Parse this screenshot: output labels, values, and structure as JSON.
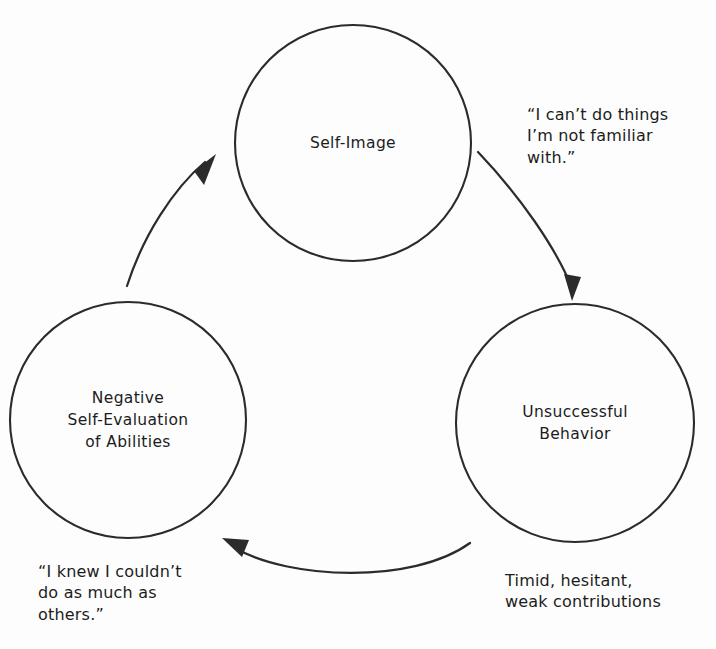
{
  "diagram": {
    "type": "cyclical-flow",
    "background_color": "#fdfdfd",
    "line_color": "#2b2b2b",
    "text_color": "#1c1c1c",
    "direction": "clockwise",
    "nodes": [
      {
        "id": "self-image",
        "label": "Self-Image",
        "position": "top",
        "center_x": 353,
        "center_y": 143,
        "radius": 118
      },
      {
        "id": "unsuccessful-behavior",
        "label": "Unsuccessful\nBehavior",
        "position": "bottom-right",
        "center_x": 575,
        "center_y": 423,
        "radius": 119
      },
      {
        "id": "negative-self-evaluation",
        "label": "Negative\nSelf-Evaluation\nof Abilities",
        "position": "bottom-left",
        "center_x": 128,
        "center_y": 420,
        "radius": 118
      }
    ],
    "captions": [
      {
        "id": "top-right",
        "text": "“I can’t do things\nI’m not familiar\nwith.”",
        "relates_to": "self-image-to-unsuccessful-behavior"
      },
      {
        "id": "bottom-right",
        "text": "Timid, hesitant,\nweak contributions",
        "relates_to": "unsuccessful-behavior"
      },
      {
        "id": "bottom-left",
        "text": "“I knew I couldn’t\ndo as much as\nothers.”",
        "relates_to": "negative-self-evaluation"
      }
    ],
    "arrows": [
      {
        "id": "arrow-self-image-to-behavior",
        "from": "self-image",
        "to": "unsuccessful-behavior",
        "path": "M 478 152 C 520 196 556 248 572 288",
        "head_points": "572,301 564,274 581,277"
      },
      {
        "id": "arrow-behavior-to-evaluation",
        "from": "unsuccessful-behavior",
        "to": "negative-self-evaluation",
        "path": "M 470 543 C 412 585 288 579 235 548",
        "head_points": "222,538 249,540 242,557"
      },
      {
        "id": "arrow-evaluation-to-self-image",
        "from": "negative-self-evaluation",
        "to": "self-image",
        "path": "M 127 286 C 143 236 173 189 205 162",
        "head_points": "216,154 194,171 204,185"
      }
    ]
  }
}
